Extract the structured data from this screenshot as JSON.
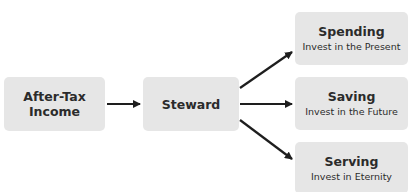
{
  "diagram": {
    "nodes": [
      {
        "id": "after_tax_income",
        "title": "After-Tax Income",
        "line1": "After-Tax",
        "line2": "Income"
      },
      {
        "id": "steward",
        "title": "Steward"
      },
      {
        "id": "spending",
        "title": "Spending",
        "subtitle": "Invest in the Present"
      },
      {
        "id": "saving",
        "title": "Saving",
        "subtitle": "Invest in the Future"
      },
      {
        "id": "serving",
        "title": "Serving",
        "subtitle": "Invest in Eternity"
      }
    ],
    "edges": [
      {
        "from": "after_tax_income",
        "to": "steward"
      },
      {
        "from": "steward",
        "to": "spending"
      },
      {
        "from": "steward",
        "to": "saving"
      },
      {
        "from": "steward",
        "to": "serving"
      }
    ],
    "colors": {
      "box_fill": "#e6e6e6",
      "arrow": "#1e1e1e",
      "text": "#2b2b2b"
    }
  }
}
